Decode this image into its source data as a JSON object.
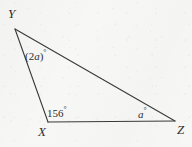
{
  "figure": {
    "type": "geometry-diagram",
    "shape": "triangle",
    "background_color": "#f7f7f6",
    "stroke_color": "#3a3a3a",
    "stroke_width": 1.1,
    "width": 192,
    "height": 147,
    "vertices": [
      {
        "name": "Y",
        "label": "Y",
        "x": 15,
        "y": 29
      },
      {
        "name": "X",
        "label": "X",
        "x": 48,
        "y": 122
      },
      {
        "name": "Z",
        "label": "Z",
        "x": 175,
        "y": 121
      }
    ],
    "edges": [
      {
        "name": "edge-yx",
        "from": "Y",
        "to": "X"
      },
      {
        "name": "edge-xz",
        "from": "X",
        "to": "Z"
      },
      {
        "name": "edge-yz",
        "from": "Y",
        "to": "Z"
      }
    ],
    "angles": [
      {
        "name": "angle-at-y",
        "vertex": "Y",
        "expression": "(2a)",
        "degree_symbol": "°",
        "text": "(2a)°",
        "prefix": "(2",
        "variable": "a",
        "suffix": ")"
      },
      {
        "name": "angle-at-x",
        "vertex": "X",
        "expression": "156",
        "degree_symbol": "°",
        "text": "156°",
        "value": 156
      },
      {
        "name": "angle-at-z",
        "vertex": "Z",
        "expression": "a",
        "degree_symbol": "°",
        "text": "a°",
        "variable": "a"
      }
    ]
  }
}
